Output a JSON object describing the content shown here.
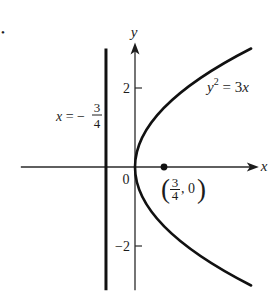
{
  "figure": {
    "marker": "•",
    "axes": {
      "x_label": "x",
      "y_label": "y",
      "origin_label": "0"
    },
    "ticks": {
      "y": [
        {
          "value": 2,
          "label": "2"
        },
        {
          "value": -2,
          "label": "−2"
        }
      ]
    },
    "parabola_label": {
      "var": "y",
      "exp": "2",
      "eq": " = 3",
      "var2": "x"
    },
    "directrix_label": {
      "var": "x",
      "eq": " = −",
      "num": "3",
      "den": "4"
    },
    "focus_label": {
      "open": "(",
      "num": "3",
      "den": "4",
      "sep": ", 0",
      "close": ")"
    }
  },
  "chart_data": {
    "type": "line",
    "title": "",
    "xlabel": "x",
    "ylabel": "y",
    "xlim": [
      -2.95,
      3.2
    ],
    "ylim": [
      -3.12,
      3.15
    ],
    "grid": false,
    "legend": null,
    "y_ticks": [
      2,
      -2
    ],
    "y_tick_labels": [
      "2",
      "−2"
    ],
    "origin_label": "0",
    "series": [
      {
        "name": "y^2 = 3x",
        "equation": "y^2 = 3x",
        "coef": 3,
        "y": [
          -3,
          -2.5,
          -2,
          -1.5,
          -1,
          -0.5,
          0,
          0.5,
          1,
          1.5,
          2,
          2.5,
          3
        ],
        "x": [
          3,
          2.083,
          1.333,
          0.75,
          0.333,
          0.083,
          0,
          0.083,
          0.333,
          0.75,
          1.333,
          2.083,
          3
        ]
      }
    ],
    "annotations": [
      {
        "type": "vertical_line",
        "name": "directrix",
        "x": -0.75,
        "y_range": [
          -3.12,
          3.0
        ],
        "label": "x = −3/4"
      },
      {
        "type": "point",
        "name": "focus",
        "x": 0.75,
        "y": 0,
        "label": "(3/4, 0)"
      },
      {
        "type": "text",
        "name": "curve_label",
        "label": "y^2 = 3x"
      }
    ]
  }
}
